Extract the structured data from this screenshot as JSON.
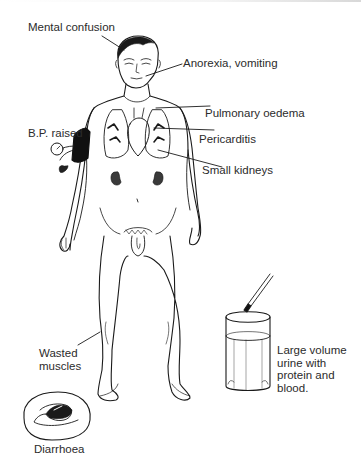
{
  "diagram": {
    "labels": {
      "mental_confusion": "Mental confusion",
      "anorexia_vomiting": "Anorexia, vomiting",
      "pulmonary_oedema": "Pulmonary oedema",
      "pericarditis": "Pericarditis",
      "bp_raised": "B.P. raised",
      "small_kidneys": "Small kidneys",
      "wasted_muscles_line1": "Wasted",
      "wasted_muscles_line2": "muscles",
      "urine_line1": "Large volume",
      "urine_line2": "urine with",
      "urine_line3": "protein and",
      "urine_line4": "blood.",
      "diarrhoea": "Diarrhoea"
    },
    "colors": {
      "ink": "#1a1a1a",
      "text": "#2b2b2b",
      "background": "#ffffff"
    }
  }
}
